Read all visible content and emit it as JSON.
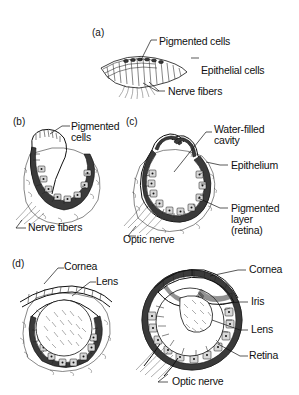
{
  "figure": {
    "background": "#ffffff",
    "ink_color": "#111111",
    "pigment_color": "#3a3a3a",
    "cell_layer_color": "#d8d8d8"
  },
  "panels": [
    {
      "id": "(a)",
      "name": "flat-pigment-spot",
      "labels": [
        {
          "name": "pigmented-cells",
          "text": "Pigmented cells"
        },
        {
          "name": "epithelial-cells",
          "text": "Epithelial cells"
        },
        {
          "name": "nerve-fibers",
          "text": "Nerve fibers"
        }
      ]
    },
    {
      "id": "(b)",
      "name": "pigment-cup",
      "labels": [
        {
          "name": "pigmented-cells",
          "text": "Pigmented"
        },
        {
          "name": "pigmented-cells-line2",
          "text": "cells"
        },
        {
          "name": "nerve-fibers",
          "text": "Nerve fibers"
        }
      ]
    },
    {
      "id": "(c)",
      "name": "pinhole-eye",
      "labels": [
        {
          "name": "water-filled-cavity",
          "text": "Water-filled"
        },
        {
          "name": "water-filled-cavity-line2",
          "text": "cavity"
        },
        {
          "name": "epithelium",
          "text": "Epithelium"
        },
        {
          "name": "pigmented-layer",
          "text": "Pigmented"
        },
        {
          "name": "pigmented-layer-line2",
          "text": "layer"
        },
        {
          "name": "pigmented-layer-line3",
          "text": "(retina)"
        },
        {
          "name": "optic-nerve",
          "text": "Optic nerve"
        }
      ]
    },
    {
      "id": "(d)",
      "name": "lens-eye-primitive",
      "labels": [
        {
          "name": "cornea",
          "text": "Cornea"
        },
        {
          "name": "lens",
          "text": "Lens"
        }
      ]
    },
    {
      "id": "",
      "name": "complex-camera-eye",
      "labels": [
        {
          "name": "cornea",
          "text": "Cornea"
        },
        {
          "name": "iris",
          "text": "Iris"
        },
        {
          "name": "lens",
          "text": "Lens"
        },
        {
          "name": "retina",
          "text": "Retina"
        },
        {
          "name": "optic-nerve",
          "text": "Optic nerve"
        }
      ]
    }
  ]
}
